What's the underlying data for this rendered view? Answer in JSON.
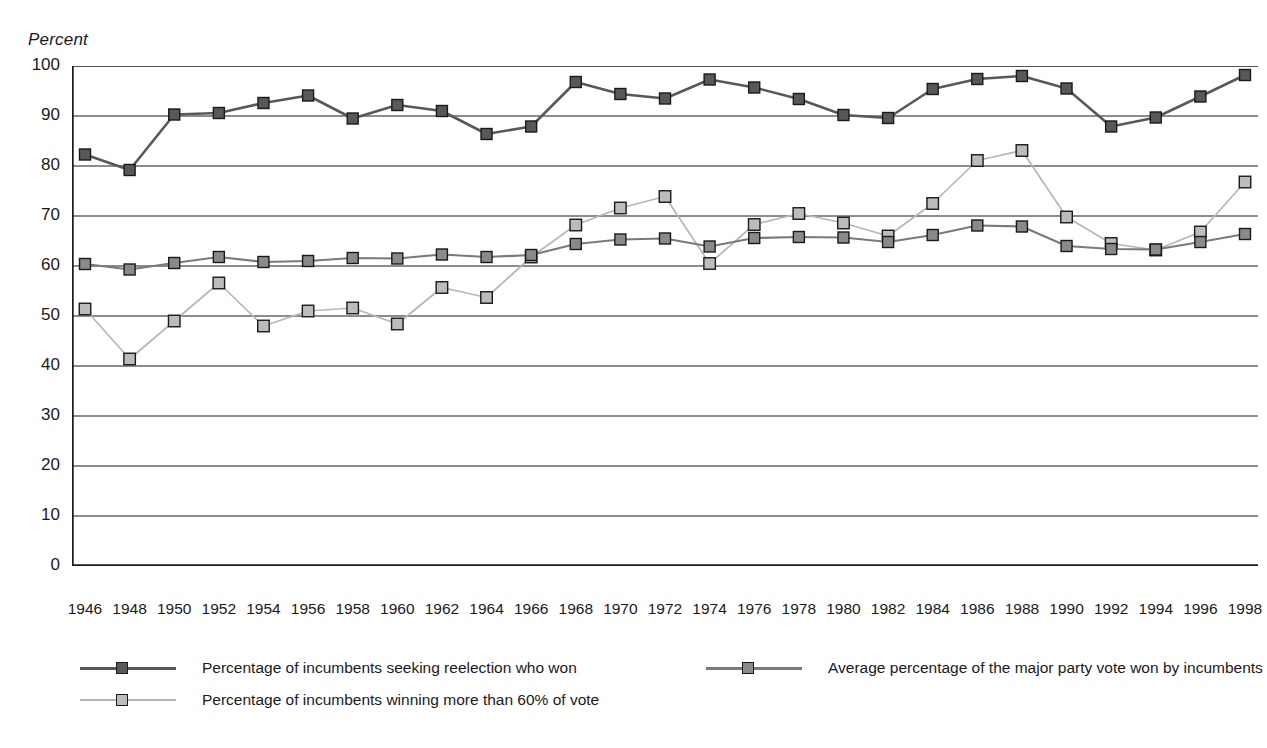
{
  "axis_title": "Percent",
  "chart_data": {
    "type": "line",
    "title": "",
    "xlabel": "",
    "ylabel": "Percent",
    "ylim": [
      0,
      100
    ],
    "ytick_step": 10,
    "yticks": [
      0,
      10,
      20,
      30,
      40,
      50,
      60,
      70,
      80,
      90,
      100
    ],
    "grid": true,
    "grid_axis": "y",
    "legend_position": "bottom",
    "categories": [
      1946,
      1948,
      1950,
      1952,
      1954,
      1956,
      1958,
      1960,
      1962,
      1964,
      1966,
      1968,
      1970,
      1972,
      1974,
      1976,
      1978,
      1980,
      1982,
      1984,
      1986,
      1988,
      1990,
      1992,
      1994,
      1996,
      1998
    ],
    "xtick_labels": [
      "1946",
      "1948",
      "1950",
      "1952",
      "1954",
      "1956",
      "1958",
      "1960",
      "1962",
      "1964",
      "1966",
      "1968",
      "1970",
      "1972",
      "1974",
      "1976",
      "1978",
      "1980",
      "1982",
      "1984",
      "1986",
      "1988",
      "1990",
      "1992",
      "1994",
      "1996",
      "1998"
    ],
    "series": [
      {
        "name": "Percentage of incumbents seeking reelection who won",
        "color": "#58585a",
        "marker_fill": "#58585a",
        "marker_edge": "#1a1a1a",
        "line_width": 2.6,
        "values": [
          82.3,
          79.2,
          90.3,
          90.6,
          92.6,
          94.1,
          89.5,
          92.2,
          91.0,
          86.4,
          87.9,
          96.8,
          94.4,
          93.5,
          97.3,
          95.7,
          93.4,
          90.2,
          89.6,
          95.4,
          97.4,
          98.0,
          95.5,
          87.9,
          89.7,
          93.9,
          98.2
        ]
      },
      {
        "name": "Average percentage of the major party vote won by incumbents",
        "color": "#7a7a7c",
        "marker_fill": "#8a8a8c",
        "marker_edge": "#1a1a1a",
        "line_width": 2.2,
        "values": [
          60.4,
          59.3,
          60.6,
          61.8,
          60.8,
          61.0,
          61.6,
          61.5,
          62.3,
          61.8,
          62.2,
          64.4,
          65.3,
          65.5,
          63.9,
          65.6,
          65.8,
          65.7,
          64.8,
          66.2,
          68.1,
          67.9,
          64.0,
          63.4,
          63.3,
          64.8,
          66.4
        ]
      },
      {
        "name": "Percentage of incumbents winning more than 60% of vote",
        "color": "#b6b6b8",
        "marker_fill": "#bcbcbe",
        "marker_edge": "#1a1a1a",
        "line_width": 1.7,
        "values": [
          51.4,
          41.4,
          49.0,
          56.6,
          48.0,
          51.0,
          51.6,
          48.4,
          55.7,
          53.7,
          61.8,
          68.2,
          71.6,
          73.9,
          60.5,
          68.3,
          70.5,
          68.6,
          66.0,
          72.5,
          81.1,
          83.1,
          69.8,
          64.5,
          63.2,
          66.8,
          76.8
        ]
      }
    ]
  },
  "legend": [
    {
      "label": "Percentage of incumbents seeking reelection who won",
      "series_index": 0
    },
    {
      "label": "Average percentage of the major party vote won by incumbents",
      "series_index": 1
    },
    {
      "label": "Percentage of incumbents winning more than 60% of vote",
      "series_index": 2
    }
  ]
}
